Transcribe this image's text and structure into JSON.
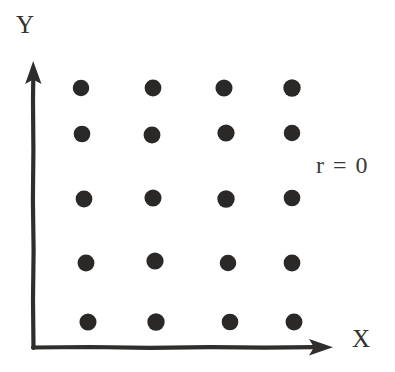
{
  "figure": {
    "background_color": "#ffffff",
    "ink_color": "#2f2e2c",
    "annotation": "r = 0"
  },
  "axes": {
    "x_label": "X",
    "y_label": "Y",
    "x_axis_name": "x-axis",
    "y_axis_name": "y-axis",
    "arrowheads": "both"
  },
  "chart_data": {
    "type": "scatter",
    "title": "",
    "subtitle": "",
    "xlabel": "X",
    "ylabel": "Y",
    "annotations": [
      {
        "text": "r = 0",
        "x_px": 316,
        "y_px": 152
      }
    ],
    "grid": false,
    "legend": null,
    "legend_position": "none",
    "axis_style": "hand-drawn arrows, no tick marks",
    "xlim": [
      0,
      5
    ],
    "ylim": [
      0,
      6
    ],
    "xticks": [],
    "yticks": [],
    "marker": {
      "shape": "circle",
      "color": "#2a2927",
      "diameter_px": 17
    },
    "n_points": 20,
    "x": [
      1,
      2,
      3,
      4,
      1,
      2,
      3,
      4,
      1,
      2,
      3,
      4,
      1,
      2,
      3,
      4,
      1,
      2,
      3,
      4
    ],
    "y": [
      5,
      5,
      5,
      5,
      4,
      4,
      4,
      4,
      3,
      3,
      3,
      3,
      2,
      2,
      2,
      2,
      1,
      1,
      1,
      1
    ],
    "points_px": [
      {
        "cx": 81,
        "cy": 88
      },
      {
        "cx": 153,
        "cy": 88
      },
      {
        "cx": 224,
        "cy": 88
      },
      {
        "cx": 292,
        "cy": 88
      },
      {
        "cx": 82,
        "cy": 134
      },
      {
        "cx": 152,
        "cy": 135
      },
      {
        "cx": 226,
        "cy": 133
      },
      {
        "cx": 292,
        "cy": 133
      },
      {
        "cx": 84,
        "cy": 199
      },
      {
        "cx": 153,
        "cy": 198
      },
      {
        "cx": 226,
        "cy": 199
      },
      {
        "cx": 292,
        "cy": 198
      },
      {
        "cx": 86,
        "cy": 263
      },
      {
        "cx": 155,
        "cy": 261
      },
      {
        "cx": 228,
        "cy": 263
      },
      {
        "cx": 292,
        "cy": 263
      },
      {
        "cx": 88,
        "cy": 322
      },
      {
        "cx": 156,
        "cy": 322
      },
      {
        "cx": 230,
        "cy": 322
      },
      {
        "cx": 294,
        "cy": 322
      }
    ]
  }
}
